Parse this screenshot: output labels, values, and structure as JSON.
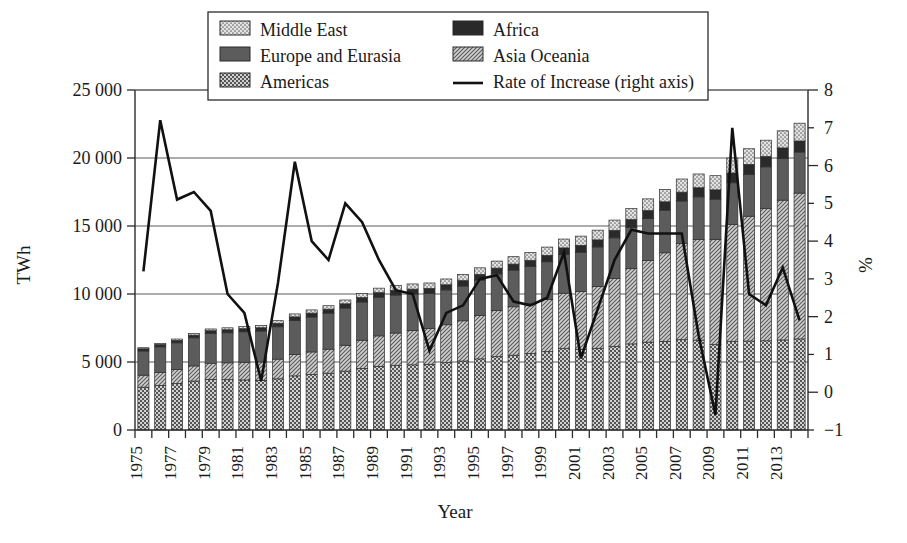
{
  "chart_data": {
    "type": "bar",
    "title": "",
    "xlabel": "Year",
    "ylabel": "TWh",
    "y2label": "%",
    "ylim": [
      0,
      25000
    ],
    "y2lim": [
      -1,
      8
    ],
    "yticks": [
      "0",
      "5 000",
      "10 000",
      "15 000",
      "20 000",
      "25 000"
    ],
    "ytick_values": [
      0,
      5000,
      10000,
      15000,
      20000,
      25000
    ],
    "y2ticks": [
      "−1",
      "0",
      "1",
      "2",
      "3",
      "4",
      "5",
      "6",
      "7",
      "8"
    ],
    "y2tick_values": [
      -1,
      0,
      1,
      2,
      3,
      4,
      5,
      6,
      7,
      8
    ],
    "grid": "horizontal",
    "legend_position": "top-center",
    "stacked": true,
    "categories": [
      1975,
      1976,
      1977,
      1978,
      1979,
      1980,
      1981,
      1982,
      1983,
      1984,
      1985,
      1986,
      1987,
      1988,
      1989,
      1990,
      1991,
      1992,
      1993,
      1994,
      1995,
      1996,
      1997,
      1998,
      1999,
      2000,
      2001,
      2002,
      2003,
      2004,
      2005,
      2006,
      2007,
      2008,
      2009,
      2010,
      2011,
      2012,
      2013,
      2014
    ],
    "tick_labels": [
      "1975",
      "",
      "1977",
      "",
      "1979",
      "",
      "1981",
      "",
      "1983",
      "",
      "1985",
      "",
      "1987",
      "",
      "1989",
      "",
      "1991",
      "",
      "1993",
      "",
      "1995",
      "",
      "1997",
      "",
      "1999",
      "",
      "2001",
      "",
      "2003",
      "",
      "2005",
      "",
      "2007",
      "",
      "2009",
      "",
      "2011",
      "",
      "2013",
      ""
    ],
    "series": [
      {
        "name": "Americas",
        "pattern": "checker",
        "values": [
          3150,
          3280,
          3420,
          3600,
          3720,
          3700,
          3680,
          3650,
          3760,
          3980,
          4080,
          4180,
          4330,
          4530,
          4680,
          4740,
          4790,
          4830,
          4950,
          5070,
          5230,
          5390,
          5500,
          5620,
          5760,
          5980,
          5940,
          6010,
          6140,
          6330,
          6460,
          6520,
          6640,
          6610,
          6280,
          6500,
          6540,
          6560,
          6620,
          6700
        ]
      },
      {
        "name": "Asia Oceania",
        "pattern": "diag",
        "values": [
          880,
          950,
          1030,
          1110,
          1190,
          1240,
          1300,
          1350,
          1450,
          1570,
          1660,
          1760,
          1900,
          2070,
          2240,
          2390,
          2520,
          2630,
          2790,
          2960,
          3180,
          3390,
          3560,
          3660,
          3830,
          4080,
          4250,
          4550,
          5010,
          5530,
          6000,
          6510,
          7060,
          7400,
          7740,
          8600,
          9180,
          9740,
          10280,
          10720
        ]
      },
      {
        "name": "Europe and Eurasia",
        "pattern": "solid-dark",
        "values": [
          1780,
          1880,
          1960,
          2070,
          2180,
          2210,
          2240,
          2280,
          2380,
          2500,
          2570,
          2650,
          2740,
          2810,
          2840,
          2790,
          2690,
          2580,
          2560,
          2560,
          2620,
          2700,
          2700,
          2740,
          2780,
          2840,
          2880,
          2900,
          2980,
          3040,
          3080,
          3130,
          3140,
          3130,
          2950,
          3080,
          3070,
          3050,
          3050,
          3020
        ]
      },
      {
        "name": "Africa",
        "pattern": "solid-black",
        "values": [
          160,
          170,
          180,
          195,
          210,
          220,
          230,
          240,
          255,
          270,
          285,
          295,
          310,
          325,
          340,
          350,
          360,
          370,
          380,
          395,
          410,
          425,
          440,
          455,
          470,
          490,
          505,
          520,
          545,
          570,
          595,
          620,
          650,
          675,
          690,
          720,
          740,
          760,
          790,
          810
        ]
      },
      {
        "name": "Middle East",
        "pattern": "dots",
        "values": [
          80,
          90,
          100,
          115,
          130,
          145,
          160,
          175,
          195,
          215,
          235,
          255,
          280,
          305,
          330,
          355,
          380,
          400,
          425,
          455,
          485,
          515,
          545,
          575,
          610,
          650,
          680,
          715,
          760,
          810,
          860,
          910,
          965,
          1010,
          1040,
          1100,
          1150,
          1200,
          1260,
          1310
        ]
      }
    ],
    "line_series": {
      "name": "Rate of Increase (right axis)",
      "axis": "right",
      "unit": "%",
      "values": [
        3.2,
        7.2,
        5.1,
        5.3,
        4.8,
        2.6,
        2.1,
        0.3,
        2.9,
        6.1,
        4.0,
        3.5,
        5.0,
        4.5,
        3.5,
        2.7,
        2.6,
        1.1,
        2.1,
        2.3,
        3.0,
        3.1,
        2.4,
        2.3,
        2.5,
        3.7,
        0.9,
        2.2,
        3.5,
        4.3,
        4.2,
        4.2,
        4.2,
        1.5,
        -0.6,
        7.0,
        2.6,
        2.3,
        3.3,
        1.9
      ]
    }
  },
  "legend": {
    "entries": [
      {
        "label": "Middle East",
        "pattern": "dots"
      },
      {
        "label": "Africa",
        "pattern": "solid-black"
      },
      {
        "label": "Europe and Eurasia",
        "pattern": "solid-dark"
      },
      {
        "label": "Asia Oceania",
        "pattern": "diag"
      },
      {
        "label": "Americas",
        "pattern": "checker"
      },
      {
        "label": "Rate of Increase (right axis)",
        "pattern": "line"
      }
    ]
  },
  "colors": {
    "axis": "#2b2b2b",
    "grid": "#5a5a5a",
    "line": "#111111",
    "americas": "#8c8c8c",
    "asia_oceania": "#9a9a9a",
    "europe_eurasia": "#5c5c5c",
    "africa": "#2a2a2a",
    "middle_east": "#bdbdbd",
    "background": "#ffffff"
  }
}
